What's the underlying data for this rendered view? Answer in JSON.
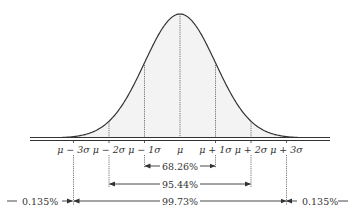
{
  "diagram": {
    "axis_labels": [
      {
        "id": "m3",
        "text": "μ − 3σ",
        "k": -3
      },
      {
        "id": "m2",
        "text": "μ − 2σ",
        "k": -2
      },
      {
        "id": "m1",
        "text": "μ − 1σ",
        "k": -1
      },
      {
        "id": "mu",
        "text": "μ",
        "k": 0
      },
      {
        "id": "p1",
        "text": "μ + 1σ",
        "k": 1
      },
      {
        "id": "p2",
        "text": "μ + 2σ",
        "k": 2
      },
      {
        "id": "p3",
        "text": "μ + 3σ",
        "k": 3
      }
    ],
    "intervals": [
      {
        "label": "68.26%",
        "range": [
          -1,
          1
        ]
      },
      {
        "label": "95.44%",
        "range": [
          -2,
          2
        ]
      },
      {
        "label": "99.73%",
        "range": [
          -3,
          3
        ]
      }
    ],
    "tails": {
      "left": "0.135%",
      "right": "0.135%"
    },
    "colors": {
      "curve": "#333333",
      "fill": "#f3f3f3",
      "text": "#333333"
    }
  }
}
